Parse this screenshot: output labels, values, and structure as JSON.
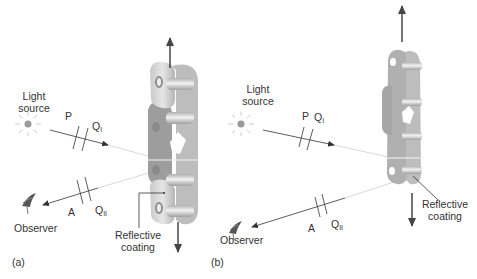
{
  "figure": {
    "panels": [
      {
        "id": "a",
        "caption": "(a)",
        "light_source_label_line1": "Light",
        "light_source_label_line2": "source",
        "polarizer_label": "P",
        "incident_wave_plate_label": "Q",
        "incident_wave_plate_sub": "I",
        "analyzer_label": "A",
        "reflected_wave_plate_label": "Q",
        "reflected_wave_plate_sub": "II",
        "observer_label": "Observer",
        "coating_label_line1": "Reflective",
        "coating_label_line2": "coating"
      },
      {
        "id": "b",
        "caption": "(b)",
        "light_source_label_line1": "Light",
        "light_source_label_line2": "source",
        "polarizer_label": "P",
        "incident_wave_plate_label": "Q",
        "incident_wave_plate_sub": "I",
        "analyzer_label": "A",
        "reflected_wave_plate_label": "Q",
        "reflected_wave_plate_sub": "II",
        "observer_label": "Observer",
        "coating_label_line1": "Reflective",
        "coating_label_line2": "coating"
      }
    ],
    "colors": {
      "line": "#333333",
      "faint_ray": "#c8c8c8",
      "chain_light": "#cfcfcf",
      "chain_mid": "#a9a9a9",
      "chain_dark": "#8c8c8c",
      "sun": "#999999"
    }
  }
}
